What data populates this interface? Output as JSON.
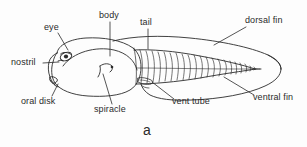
{
  "figure": {
    "caption": "a",
    "line_color": "#2b2b2b",
    "background_color": "#fdfdfd",
    "width": 307,
    "height": 147
  },
  "labels": {
    "eye": "eye",
    "nostril": "nostril",
    "oral_disk": "oral disk",
    "body": "body",
    "spiracle": "spiracle",
    "tail": "tail",
    "vent_tube": "vent tube",
    "dorsal_fin": "dorsal fin",
    "ventral_fin": "ventral fin"
  }
}
